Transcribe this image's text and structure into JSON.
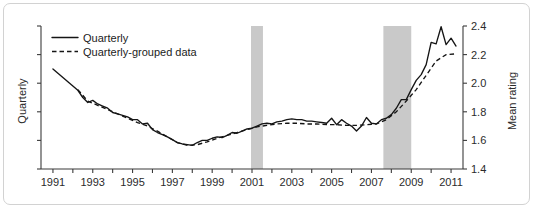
{
  "figure": {
    "frame_border_color": "#d2d2d2",
    "background_color": "#ffffff"
  },
  "chart_data": {
    "type": "line",
    "title": "",
    "subtitle": "",
    "xlabel": "",
    "ylabel": "Quarterly",
    "ylabel_right": "Mean rating",
    "xlim": [
      1990.4,
      2011.6
    ],
    "ylim": [
      1.4,
      2.4
    ],
    "grid": false,
    "legend_position": "top-left",
    "x_tick_labels": [
      "1991",
      "1993",
      "1995",
      "1997",
      "1999",
      "2001",
      "2003",
      "2005",
      "2007",
      "2009",
      "2011"
    ],
    "x_tick_values": [
      1991,
      1993,
      1995,
      1997,
      1999,
      2001,
      2003,
      2005,
      2007,
      2009,
      2011
    ],
    "x_minor_tick_values": [
      1992,
      1994,
      1996,
      1998,
      2000,
      2002,
      2004,
      2006,
      2008,
      2010
    ],
    "y_tick_labels": [
      "1.4",
      "1.6",
      "1.8",
      "2.0",
      "2.2",
      "2.4"
    ],
    "y_tick_values": [
      1.4,
      1.6,
      1.8,
      2.0,
      2.2,
      2.4
    ],
    "left_axis_tick_values": [
      1.4,
      1.6,
      1.8,
      2.0,
      2.2,
      2.4
    ],
    "left_axis_tick_labels": [
      "",
      "",
      "",
      "",
      "",
      ""
    ],
    "series": [
      {
        "name": "Quarterly",
        "style": "solid",
        "color": "#151515",
        "x": [
          1991.0,
          1991.25,
          1991.5,
          1991.75,
          1992.0,
          1992.25,
          1992.5,
          1992.75,
          1993.0,
          1993.25,
          1993.5,
          1993.75,
          1994.0,
          1994.25,
          1994.5,
          1994.75,
          1995.0,
          1995.25,
          1995.5,
          1995.75,
          1996.0,
          1996.25,
          1996.5,
          1996.75,
          1997.0,
          1997.25,
          1997.5,
          1997.75,
          1998.0,
          1998.25,
          1998.5,
          1998.75,
          1999.0,
          1999.25,
          1999.5,
          1999.75,
          2000.0,
          2000.25,
          2000.5,
          2000.75,
          2001.0,
          2001.25,
          2001.5,
          2001.75,
          2002.0,
          2002.25,
          2002.5,
          2002.75,
          2003.0,
          2003.25,
          2003.5,
          2003.75,
          2004.0,
          2004.25,
          2004.5,
          2004.75,
          2005.0,
          2005.25,
          2005.5,
          2005.75,
          2006.0,
          2006.25,
          2006.5,
          2006.75,
          2007.0,
          2007.25,
          2007.5,
          2007.75,
          2008.0,
          2008.25,
          2008.5,
          2008.75,
          2009.0,
          2009.25,
          2009.5,
          2009.75,
          2010.0,
          2010.25,
          2010.5,
          2010.75,
          2011.0,
          2011.25
        ],
        "values": [
          2.1,
          2.07,
          2.04,
          2.01,
          1.98,
          1.95,
          1.9,
          1.865,
          1.88,
          1.855,
          1.84,
          1.825,
          1.795,
          1.785,
          1.775,
          1.765,
          1.745,
          1.745,
          1.715,
          1.72,
          1.675,
          1.655,
          1.64,
          1.625,
          1.605,
          1.585,
          1.575,
          1.57,
          1.565,
          1.585,
          1.6,
          1.6,
          1.615,
          1.625,
          1.62,
          1.635,
          1.655,
          1.65,
          1.665,
          1.68,
          1.685,
          1.7,
          1.715,
          1.72,
          1.715,
          1.73,
          1.735,
          1.745,
          1.75,
          1.745,
          1.745,
          1.735,
          1.735,
          1.73,
          1.725,
          1.72,
          1.755,
          1.71,
          1.745,
          1.72,
          1.7,
          1.665,
          1.7,
          1.76,
          1.72,
          1.715,
          1.745,
          1.755,
          1.78,
          1.825,
          1.885,
          1.885,
          1.955,
          2.02,
          2.06,
          2.13,
          2.285,
          2.275,
          2.395,
          2.27,
          2.315,
          2.26
        ]
      },
      {
        "name": "Quarterly-grouped data",
        "style": "dashed",
        "color": "#151515",
        "x": [
          1992.25,
          1992.75,
          1993.25,
          1993.75,
          1994.25,
          1994.75,
          1995.25,
          1995.75,
          1996.25,
          1996.75,
          1997.25,
          1997.75,
          1998.25,
          1998.75,
          1999.25,
          1999.75,
          2000.25,
          2000.75,
          2001.25,
          2001.75,
          2002.25,
          2002.75,
          2003.25,
          2003.75,
          2004.25,
          2004.75,
          2005.25,
          2005.75,
          2006.25,
          2006.75,
          2007.25,
          2007.75,
          2008.25,
          2008.75,
          2009.25,
          2009.75,
          2010.25,
          2010.75,
          2011.25
        ],
        "values": [
          1.955,
          1.875,
          1.845,
          1.815,
          1.785,
          1.755,
          1.725,
          1.7,
          1.665,
          1.625,
          1.585,
          1.565,
          1.57,
          1.59,
          1.615,
          1.635,
          1.655,
          1.675,
          1.695,
          1.705,
          1.715,
          1.72,
          1.72,
          1.715,
          1.715,
          1.71,
          1.71,
          1.705,
          1.705,
          1.71,
          1.715,
          1.745,
          1.8,
          1.875,
          1.955,
          2.055,
          2.155,
          2.2,
          2.205
        ]
      }
    ],
    "annotations": [
      {
        "type": "vertical-band",
        "name": "recession-band-2001",
        "x_start": 2000.95,
        "x_end": 2001.55,
        "color": "#c9c9c9"
      },
      {
        "type": "vertical-band",
        "name": "recession-band-2008",
        "x_start": 2007.6,
        "x_end": 2009.0,
        "color": "#c9c9c9"
      }
    ]
  },
  "legend": {
    "entries": [
      {
        "label": "Quarterly",
        "style": "solid"
      },
      {
        "label": "Quarterly-grouped data",
        "style": "dashed"
      }
    ]
  }
}
